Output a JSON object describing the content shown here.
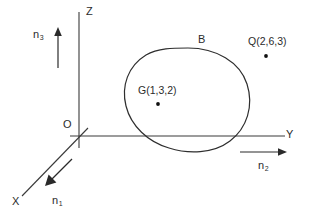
{
  "figure": {
    "background_color": "#ffffff",
    "stroke_color": "#3a3a3a",
    "axes": [
      {
        "id": "x",
        "label": "X",
        "direction": "down-left-diagonal",
        "unit_vector_label": "n1"
      },
      {
        "id": "y",
        "label": "Y",
        "direction": "right-horizontal",
        "unit_vector_label": "n2"
      },
      {
        "id": "z",
        "label": "Z",
        "direction": "up-vertical",
        "unit_vector_label": "n3"
      }
    ],
    "origin_label": "O",
    "labels": {
      "z_axis": "Z",
      "y_axis": "Y",
      "x_axis": "X",
      "origin": "O",
      "n1_base": "n",
      "n1_sub": "1",
      "n2_base": "n",
      "n2_sub": "2",
      "n3_base": "n",
      "n3_sub": "3",
      "region": "B",
      "centroid": "G(1,3,2)",
      "point_q": "Q(2,6,3)"
    },
    "points": [
      {
        "name": "G",
        "label": "G(1,3,2)",
        "coords": [
          1,
          3,
          2
        ]
      },
      {
        "name": "Q",
        "label": "Q(2,6,3)",
        "coords": [
          2,
          6,
          3
        ]
      }
    ],
    "region": {
      "name": "B",
      "shape": "closed-blob"
    }
  }
}
